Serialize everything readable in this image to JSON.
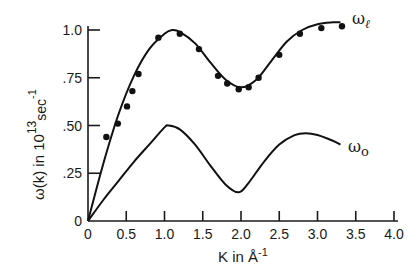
{
  "chart_data": {
    "type": "line",
    "title": "",
    "xlabel": "K in Å⁻¹",
    "ylabel": "ω(k) in 10¹³ sec⁻¹",
    "xlim": [
      0,
      4.0
    ],
    "ylim": [
      0,
      1.0
    ],
    "grid": false,
    "x_ticks": [
      "0",
      "0.5",
      "1.0",
      "1.5",
      "2.0",
      "2.5",
      "3.0",
      "3.5",
      "4.0"
    ],
    "y_ticks": [
      "0",
      ".25",
      ".50",
      ".75",
      "1.0"
    ],
    "series": [
      {
        "name": "ω_ℓ",
        "kind": "curve",
        "x": [
          0,
          0.2,
          0.4,
          0.6,
          0.8,
          1.0,
          1.1,
          1.2,
          1.4,
          1.6,
          1.8,
          2.0,
          2.2,
          2.4,
          2.6,
          2.8,
          3.0,
          3.2,
          3.3
        ],
        "values": [
          0,
          0.3,
          0.56,
          0.76,
          0.9,
          0.98,
          1.0,
          0.99,
          0.93,
          0.83,
          0.74,
          0.7,
          0.74,
          0.84,
          0.94,
          1.0,
          1.03,
          1.04,
          1.04
        ]
      },
      {
        "name": "ω_ℓ data",
        "kind": "points",
        "x": [
          0.24,
          0.39,
          0.51,
          0.58,
          0.66,
          0.92,
          1.2,
          1.45,
          1.7,
          1.82,
          1.97,
          2.1,
          2.23,
          2.5,
          2.77,
          3.05,
          3.32
        ],
        "values": [
          0.44,
          0.51,
          0.6,
          0.68,
          0.77,
          0.96,
          0.98,
          0.9,
          0.76,
          0.72,
          0.69,
          0.7,
          0.75,
          0.87,
          0.98,
          1.01,
          1.02
        ]
      },
      {
        "name": "ω_0",
        "kind": "curve",
        "x": [
          0,
          0.2,
          0.4,
          0.6,
          0.8,
          1.0,
          1.05,
          1.2,
          1.4,
          1.6,
          1.8,
          1.97,
          2.1,
          2.3,
          2.5,
          2.7,
          2.85,
          3.0,
          3.2,
          3.3
        ],
        "values": [
          0,
          0.11,
          0.21,
          0.31,
          0.4,
          0.49,
          0.5,
          0.48,
          0.4,
          0.29,
          0.19,
          0.15,
          0.2,
          0.31,
          0.4,
          0.45,
          0.46,
          0.45,
          0.42,
          0.4
        ]
      }
    ],
    "legend": {
      "position": "inline-right",
      "labels": [
        "ω_ℓ",
        "ω_0"
      ]
    }
  },
  "labels": {
    "x_axis": "K in Å",
    "x_axis_sup": "-1",
    "y_axis_main": "ω(k) in 10",
    "y_axis_sup": "13",
    "y_axis_unit": "sec",
    "y_axis_unit_sup": "-1",
    "series_l": "ω",
    "series_l_sub": "ℓ",
    "series_0": "ω",
    "series_0_sub": "o"
  }
}
